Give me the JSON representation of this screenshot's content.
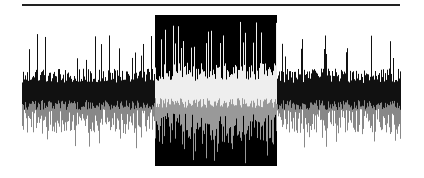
{
  "editor": {
    "background": "#ffffff",
    "timeline_bar": {
      "x": 22,
      "y": 4,
      "width": 378,
      "height": 2,
      "color": "#222222"
    }
  },
  "waveform": {
    "x_start": 22,
    "x_end": 400,
    "center_y": 92,
    "seed": 1337,
    "top_color": "#111111",
    "bottom_color": "#888888",
    "selected_top_color": "#eeeeee",
    "selected_bottom_color": "#999999",
    "base_amplitude_top": 18,
    "base_amplitude_bottom": 28,
    "peak_amplitude_top": 58,
    "peak_amplitude_bottom": 58,
    "selected_amp_boost": 1.25
  },
  "selection": {
    "x": 155,
    "y": 15,
    "width": 122,
    "height": 151,
    "background": "#000000"
  }
}
